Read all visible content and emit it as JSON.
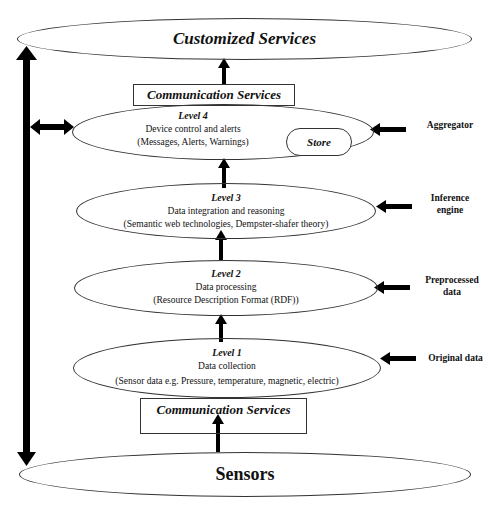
{
  "diagram": {
    "top": {
      "label": "Customized Services"
    },
    "bottom": {
      "label": "Sensors"
    },
    "communication_top": {
      "label": "Communication Services"
    },
    "communication_bottom": {
      "label": "Communication Services"
    },
    "levels": [
      {
        "id": "level4",
        "title": "Level 4",
        "line1": "Device control and alerts",
        "line2": "(Messages, Alerts, Warnings)",
        "store": "Store",
        "side": [
          "Aggregator"
        ]
      },
      {
        "id": "level3",
        "title": "Level 3",
        "line1": "Data integration and reasoning",
        "line2": "(Semantic web technologies, Dempster-shafer theory)",
        "side": [
          "Inference",
          "engine"
        ]
      },
      {
        "id": "level2",
        "title": "Level 2",
        "line1": "Data processing",
        "line2": "(Resource Description Format (RDF))",
        "side": [
          "Preprocessed",
          "data"
        ]
      },
      {
        "id": "level1",
        "title": "Level 1",
        "line1": "Data collection",
        "line2": "(Sensor data e.g. Pressure, temperature, magnetic, electric)",
        "side": [
          "Original data"
        ]
      }
    ],
    "colors": {
      "stroke": "#333333",
      "arrow": "#000000",
      "background": "#ffffff"
    }
  }
}
